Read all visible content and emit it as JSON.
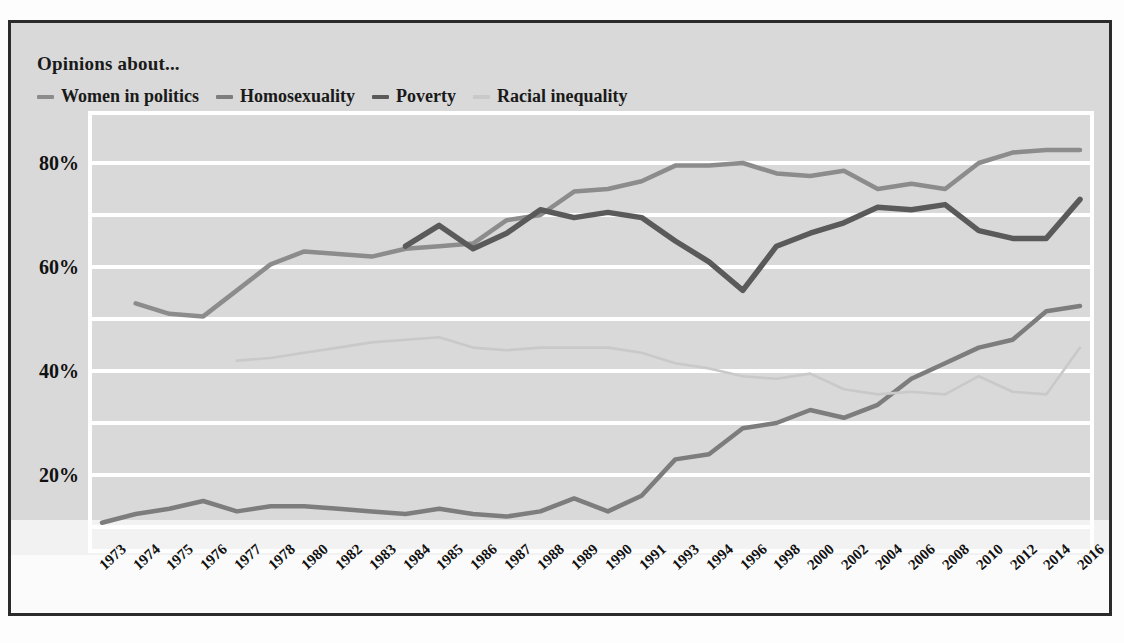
{
  "legend": {
    "title": "Opinions about...",
    "items": [
      {
        "label": "Women in politics",
        "color": "#8c8c8c"
      },
      {
        "label": "Homosexuality",
        "color": "#7d7d7d"
      },
      {
        "label": "Poverty",
        "color": "#5a5a5a"
      },
      {
        "label": "Racial inequality",
        "color": "#c9c9c9"
      }
    ]
  },
  "chart_data": {
    "type": "line",
    "title": "Opinions about...",
    "xlabel": "",
    "ylabel": "",
    "ylim": [
      5,
      90
    ],
    "ytick_values": [
      20,
      40,
      60,
      80
    ],
    "ytick_labels": [
      "20%",
      "40%",
      "60%",
      "80%"
    ],
    "gridlines": [
      10,
      20,
      30,
      40,
      50,
      60,
      70,
      80
    ],
    "grid": true,
    "legend_position": "top-left",
    "categories": [
      "1973",
      "1974",
      "1975",
      "1976",
      "1977",
      "1978",
      "1980",
      "1982",
      "1983",
      "1984",
      "1985",
      "1986",
      "1987",
      "1988",
      "1989",
      "1990",
      "1991",
      "1993",
      "1994",
      "1996",
      "1998",
      "2000",
      "2002",
      "2004",
      "2006",
      "2008",
      "2010",
      "2012",
      "2014",
      "2016"
    ],
    "series": [
      {
        "name": "Women in politics",
        "color": "#8c8c8c",
        "width": 4.5,
        "values": [
          null,
          53.0,
          51.0,
          50.5,
          55.5,
          60.5,
          63.0,
          62.5,
          62.0,
          63.5,
          64.0,
          64.5,
          69.0,
          70.0,
          74.5,
          75.0,
          76.5,
          79.5,
          79.5,
          80.0,
          78.0,
          77.5,
          78.5,
          75.0,
          76.0,
          75.0,
          80.0,
          82.0,
          82.5,
          82.5
        ]
      },
      {
        "name": "Homosexuality",
        "color": "#7d7d7d",
        "width": 4.5,
        "values": [
          10.8,
          12.5,
          13.5,
          15.0,
          13.0,
          14.0,
          14.0,
          13.5,
          13.0,
          12.5,
          13.5,
          12.5,
          12.0,
          13.0,
          15.5,
          13.0,
          16.0,
          23.0,
          24.0,
          29.0,
          30.0,
          32.5,
          31.0,
          33.5,
          38.5,
          41.5,
          44.5,
          46.0,
          51.5,
          52.5
        ]
      },
      {
        "name": "Poverty",
        "color": "#5a5a5a",
        "width": 5.5,
        "values": [
          null,
          null,
          null,
          null,
          null,
          null,
          null,
          null,
          null,
          64.0,
          68.0,
          63.5,
          66.5,
          71.0,
          69.5,
          70.5,
          69.5,
          65.0,
          61.0,
          55.5,
          64.0,
          66.5,
          68.5,
          71.5,
          71.0,
          72.0,
          67.0,
          65.5,
          65.5,
          73.0
        ]
      },
      {
        "name": "Racial inequality",
        "color": "#c9c9c9",
        "width": 2.6,
        "values": [
          null,
          null,
          null,
          null,
          42.0,
          42.5,
          43.5,
          44.5,
          45.5,
          46.0,
          46.5,
          44.5,
          44.0,
          44.5,
          44.5,
          44.5,
          43.5,
          41.5,
          40.5,
          39.0,
          38.5,
          39.5,
          36.5,
          35.5,
          36.0,
          35.5,
          39.0,
          36.0,
          35.5,
          44.5
        ]
      }
    ]
  }
}
